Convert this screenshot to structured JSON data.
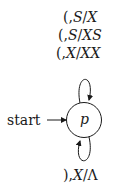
{
  "diagram": {
    "type": "pushdown-automaton-state-diagram",
    "start_label": "start",
    "states": [
      {
        "id": "p",
        "label": "p",
        "initial": true
      }
    ],
    "transitions": [
      {
        "from": "p",
        "to": "p",
        "position": "top",
        "labels": [
          {
            "input": "(",
            "pop": "S",
            "push": "X",
            "text": "(, S/X"
          },
          {
            "input": "(",
            "pop": "S",
            "push": "XS",
            "text": "(, S/XS"
          },
          {
            "input": "(",
            "pop": "X",
            "push": "XX",
            "text": "(, X/XX"
          }
        ]
      },
      {
        "from": "p",
        "to": "p",
        "position": "bottom",
        "labels": [
          {
            "input": ")",
            "pop": "X",
            "push": "Λ",
            "text": "), X/Λ"
          }
        ]
      }
    ]
  },
  "labels": {
    "top1": {
      "sym": "(,",
      "a": "S",
      "b": "X"
    },
    "top2": {
      "sym": "(,",
      "a": "S",
      "b": "XS"
    },
    "top3": {
      "sym": "(,",
      "a": "X",
      "b": "XX"
    },
    "bottom": {
      "sym": "),",
      "a": "X",
      "b": "Λ"
    },
    "start": "start",
    "state": "p",
    "slash": "/"
  }
}
